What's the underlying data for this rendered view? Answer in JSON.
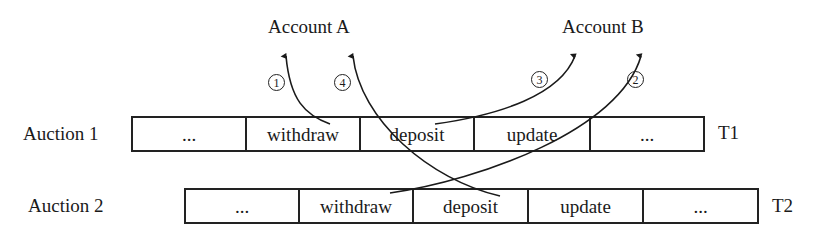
{
  "diagram": {
    "accounts": [
      {
        "id": "A",
        "label": "Account A"
      },
      {
        "id": "B",
        "label": "Account B"
      }
    ],
    "transactions": [
      {
        "row_label": "Auction 1",
        "thread_label": "T1",
        "cells": [
          "...",
          "withdraw",
          "deposit",
          "update",
          "..."
        ]
      },
      {
        "row_label": "Auction 2",
        "thread_label": "T2",
        "cells": [
          "...",
          "withdraw",
          "deposit",
          "update",
          "..."
        ]
      }
    ],
    "arrows": [
      {
        "step": "1",
        "from": "Auction 1 withdraw",
        "to": "Account A"
      },
      {
        "step": "2",
        "from": "Auction 2 withdraw",
        "to": "Account B"
      },
      {
        "step": "3",
        "from": "Auction 1 deposit",
        "to": "Account B"
      },
      {
        "step": "4",
        "from": "Auction 2 deposit",
        "to": "Account A"
      }
    ],
    "step_markers": [
      "①",
      "②",
      "③",
      "④"
    ]
  }
}
